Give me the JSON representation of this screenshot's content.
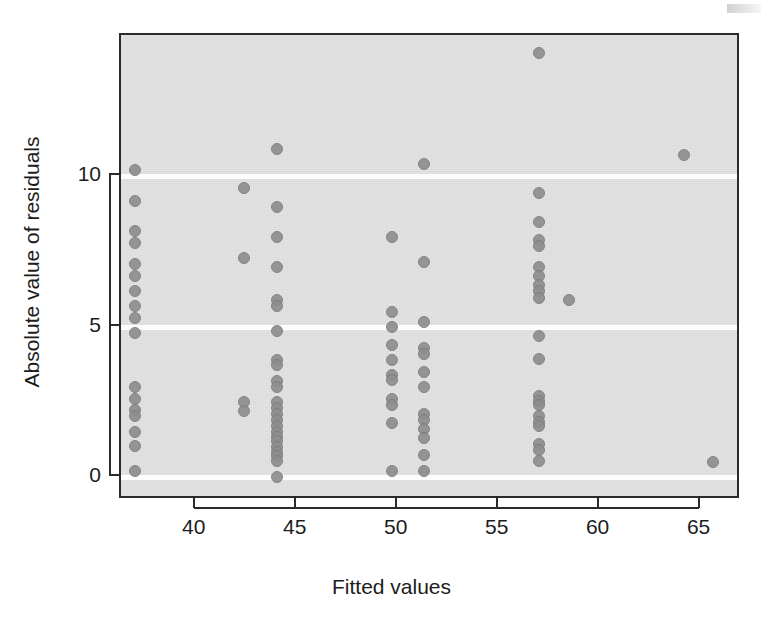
{
  "chart_data": {
    "type": "scatter",
    "title": "",
    "xlabel": "Fitted values",
    "ylabel": "Absolute value of residuals",
    "xlim": [
      36.3,
      67.0
    ],
    "ylim": [
      -0.75,
      14.7
    ],
    "xticks": [
      40,
      45,
      50,
      55,
      60,
      65
    ],
    "xticklabels": [
      "40",
      "45",
      "50",
      "55",
      "60",
      "65"
    ],
    "yticks": [
      0,
      5,
      10
    ],
    "yticklabels": [
      "0",
      "5",
      "10"
    ],
    "grid": "horizontal white reference lines at y = 0, 5, 10",
    "legend": "none",
    "marker": {
      "shape": "circle",
      "fill_color": "#8e8e8e",
      "edge_color": "#7d7d7d",
      "size_px": 12
    },
    "panel_background": "#e3e3e3",
    "frame_color": "#2b2b2b",
    "n_points": 96,
    "points": [
      [
        37.0,
        10.2
      ],
      [
        37.0,
        9.2
      ],
      [
        37.0,
        8.2
      ],
      [
        37.0,
        7.8
      ],
      [
        37.0,
        7.1
      ],
      [
        37.0,
        6.7
      ],
      [
        37.0,
        6.2
      ],
      [
        37.0,
        5.7
      ],
      [
        37.0,
        5.3
      ],
      [
        37.0,
        4.8
      ],
      [
        37.0,
        3.0
      ],
      [
        37.0,
        2.6
      ],
      [
        37.0,
        2.25
      ],
      [
        37.0,
        2.05
      ],
      [
        37.0,
        1.5
      ],
      [
        37.0,
        1.05
      ],
      [
        37.0,
        0.2
      ],
      [
        42.4,
        9.6
      ],
      [
        42.4,
        7.3
      ],
      [
        42.4,
        2.5
      ],
      [
        42.4,
        2.2
      ],
      [
        44.0,
        10.9
      ],
      [
        44.0,
        9.0
      ],
      [
        44.0,
        8.0
      ],
      [
        44.0,
        7.0
      ],
      [
        44.0,
        5.9
      ],
      [
        44.0,
        5.7
      ],
      [
        44.0,
        4.85
      ],
      [
        44.0,
        3.9
      ],
      [
        44.0,
        3.75
      ],
      [
        44.0,
        3.2
      ],
      [
        44.0,
        3.0
      ],
      [
        44.0,
        2.5
      ],
      [
        44.0,
        2.3
      ],
      [
        44.0,
        2.1
      ],
      [
        44.0,
        1.9
      ],
      [
        44.0,
        1.7
      ],
      [
        44.0,
        1.5
      ],
      [
        44.0,
        1.35
      ],
      [
        44.0,
        1.2
      ],
      [
        44.0,
        1.0
      ],
      [
        44.0,
        0.85
      ],
      [
        44.0,
        0.7
      ],
      [
        44.0,
        0.55
      ],
      [
        44.0,
        0.0
      ],
      [
        49.7,
        8.0
      ],
      [
        49.7,
        5.5
      ],
      [
        49.7,
        5.0
      ],
      [
        49.7,
        4.4
      ],
      [
        49.7,
        3.9
      ],
      [
        49.7,
        3.4
      ],
      [
        49.7,
        3.25
      ],
      [
        49.7,
        2.6
      ],
      [
        49.7,
        2.4
      ],
      [
        49.7,
        1.8
      ],
      [
        49.7,
        0.2
      ],
      [
        51.3,
        10.4
      ],
      [
        51.3,
        7.15
      ],
      [
        51.3,
        5.15
      ],
      [
        51.3,
        4.3
      ],
      [
        51.3,
        4.1
      ],
      [
        51.3,
        3.5
      ],
      [
        51.3,
        3.0
      ],
      [
        51.3,
        2.1
      ],
      [
        51.3,
        1.9
      ],
      [
        51.3,
        1.6
      ],
      [
        51.3,
        1.3
      ],
      [
        51.3,
        0.75
      ],
      [
        51.3,
        0.2
      ],
      [
        57.0,
        14.1
      ],
      [
        57.0,
        9.45
      ],
      [
        57.0,
        8.5
      ],
      [
        57.0,
        7.9
      ],
      [
        57.0,
        7.7
      ],
      [
        57.0,
        7.0
      ],
      [
        57.0,
        6.7
      ],
      [
        57.0,
        6.4
      ],
      [
        57.0,
        6.2
      ],
      [
        57.0,
        5.95
      ],
      [
        57.0,
        4.7
      ],
      [
        57.0,
        3.95
      ],
      [
        57.0,
        2.7
      ],
      [
        57.0,
        2.55
      ],
      [
        57.0,
        2.4
      ],
      [
        57.0,
        2.05
      ],
      [
        57.0,
        1.85
      ],
      [
        57.0,
        1.7
      ],
      [
        57.0,
        1.1
      ],
      [
        57.0,
        0.9
      ],
      [
        57.0,
        0.55
      ],
      [
        58.5,
        5.9
      ],
      [
        64.2,
        10.7
      ],
      [
        65.6,
        0.5
      ]
    ]
  },
  "axes": {
    "x_tick_labels": [
      "40",
      "45",
      "50",
      "55",
      "60",
      "65"
    ],
    "y_tick_labels": [
      "0",
      "5",
      "10"
    ],
    "x_axis_title": "Fitted values",
    "y_axis_title": "Absolute value of residuals"
  }
}
